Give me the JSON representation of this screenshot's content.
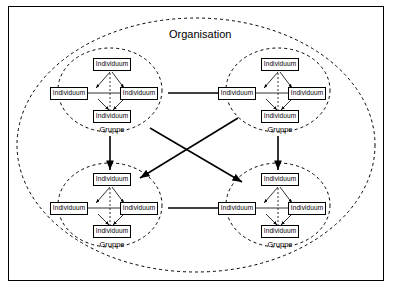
{
  "diagram": {
    "title": "Organisation",
    "group_label": "Gruppe",
    "node_label": "Individuum",
    "colors": {
      "stroke": "#000000",
      "background": "#ffffff",
      "frame": "#000000"
    },
    "groups": [
      {
        "id": "group-top-left",
        "label": "Gruppe",
        "nodes": [
          {
            "label": "Individuum",
            "position": "top"
          },
          {
            "label": "Individuum",
            "position": "left"
          },
          {
            "label": "Individuum",
            "position": "right"
          },
          {
            "label": "Individuum",
            "position": "bottom"
          }
        ]
      },
      {
        "id": "group-top-right",
        "label": "Gruppe",
        "nodes": [
          {
            "label": "Individuum",
            "position": "top"
          },
          {
            "label": "Individuum",
            "position": "left"
          },
          {
            "label": "Individuum",
            "position": "right"
          },
          {
            "label": "Individuum",
            "position": "bottom"
          }
        ]
      },
      {
        "id": "group-bottom-left",
        "label": "Gruppe",
        "nodes": [
          {
            "label": "Individuum",
            "position": "top"
          },
          {
            "label": "Individuum",
            "position": "left"
          },
          {
            "label": "Individuum",
            "position": "right"
          },
          {
            "label": "Individuum",
            "position": "bottom"
          }
        ]
      },
      {
        "id": "group-bottom-right",
        "label": "Gruppe",
        "nodes": [
          {
            "label": "Individuum",
            "position": "top"
          },
          {
            "label": "Individuum",
            "position": "left"
          },
          {
            "label": "Individuum",
            "position": "right"
          },
          {
            "label": "Individuum",
            "position": "bottom"
          }
        ]
      }
    ]
  }
}
